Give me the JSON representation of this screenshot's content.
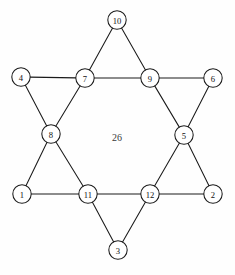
{
  "figure": {
    "center_label": "26",
    "stroke_color": "#1a1a1a",
    "node_fill": "#ffffff",
    "label_color": "#111111",
    "background": "#fefefe",
    "node_radius": 9.2
  },
  "nodes": [
    {
      "id": "n10",
      "label": "10",
      "x": 117,
      "y": 20
    },
    {
      "id": "n4",
      "label": "4",
      "x": 21,
      "y": 77
    },
    {
      "id": "n7",
      "label": "7",
      "x": 85,
      "y": 78
    },
    {
      "id": "n9",
      "label": "9",
      "x": 150,
      "y": 78
    },
    {
      "id": "n6",
      "label": "6",
      "x": 213,
      "y": 78
    },
    {
      "id": "n8",
      "label": "8",
      "x": 51,
      "y": 134
    },
    {
      "id": "n5",
      "label": "5",
      "x": 184,
      "y": 135
    },
    {
      "id": "n1",
      "label": "1",
      "x": 22,
      "y": 194
    },
    {
      "id": "n11",
      "label": "11",
      "x": 88,
      "y": 194
    },
    {
      "id": "n12",
      "label": "12",
      "x": 150,
      "y": 194
    },
    {
      "id": "n2",
      "label": "2",
      "x": 213,
      "y": 194
    },
    {
      "id": "n3",
      "label": "3",
      "x": 118,
      "y": 250
    }
  ],
  "edges": [
    {
      "from": "n10",
      "to": "n7",
      "name": "edge-10-7"
    },
    {
      "from": "n10",
      "to": "n9",
      "name": "edge-10-9"
    },
    {
      "from": "n4",
      "to": "n7",
      "name": "edge-4-7"
    },
    {
      "from": "n7",
      "to": "n9",
      "name": "edge-7-9"
    },
    {
      "from": "n9",
      "to": "n6",
      "name": "edge-9-6"
    },
    {
      "from": "n4",
      "to": "n8",
      "name": "edge-4-8"
    },
    {
      "from": "n7",
      "to": "n8",
      "name": "edge-7-8"
    },
    {
      "from": "n9",
      "to": "n5",
      "name": "edge-9-5"
    },
    {
      "from": "n6",
      "to": "n5",
      "name": "edge-6-5"
    },
    {
      "from": "n8",
      "to": "n1",
      "name": "edge-8-1"
    },
    {
      "from": "n8",
      "to": "n11",
      "name": "edge-8-11"
    },
    {
      "from": "n5",
      "to": "n12",
      "name": "edge-5-12"
    },
    {
      "from": "n5",
      "to": "n2",
      "name": "edge-5-2"
    },
    {
      "from": "n1",
      "to": "n11",
      "name": "edge-1-11"
    },
    {
      "from": "n11",
      "to": "n12",
      "name": "edge-11-12"
    },
    {
      "from": "n12",
      "to": "n2",
      "name": "edge-12-2"
    },
    {
      "from": "n11",
      "to": "n3",
      "name": "edge-11-3"
    },
    {
      "from": "n12",
      "to": "n3",
      "name": "edge-12-3"
    }
  ]
}
